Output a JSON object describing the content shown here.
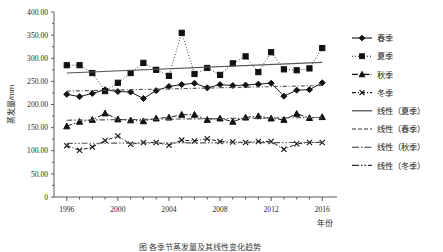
{
  "figure": {
    "caption": "图 各季节蒸发量及其线性变化趋势",
    "background": "#ffffff",
    "ink_color": "#111111",
    "trend_color": "#555555"
  },
  "axes": {
    "y_title": "蒸发量/mm",
    "x_title": "年份",
    "y_ticklabels": [
      "400.00",
      "350.00",
      "300.00",
      "250.00",
      "200.00",
      "150.00",
      "100.00",
      "50.00",
      "0"
    ],
    "y_tickvalues": [
      400,
      350,
      300,
      250,
      200,
      150,
      100,
      50,
      0
    ],
    "x_ticklabels": [
      "1996",
      "2000",
      "2004",
      "2008",
      "2012",
      "2016"
    ],
    "x_tickvalues": [
      1996,
      2000,
      2004,
      2008,
      2012,
      2016
    ]
  },
  "legend": {
    "items": [
      {
        "label": "春季",
        "style": "solid-diamond",
        "marker": "diamond",
        "dash": "none"
      },
      {
        "label": "夏季",
        "style": "dotted-square",
        "marker": "square",
        "dash": "1,2"
      },
      {
        "label": "秋季",
        "style": "dashdot-triangle",
        "marker": "triangle",
        "dash": "6,2,1.5,2"
      },
      {
        "label": "冬季",
        "style": "dashed-cross",
        "marker": "cross",
        "dash": "4,2,1,2"
      },
      {
        "label": "线性（夏季）",
        "style": "solid-line",
        "marker": "none",
        "dash": "none"
      },
      {
        "label": "线性（春季）",
        "style": "dashed-line",
        "marker": "none",
        "dash": "4,2"
      },
      {
        "label": "线性（秋季）",
        "style": "dashdot-line",
        "marker": "none",
        "dash": "7,2,1.5,2"
      },
      {
        "label": "线性（冬季）",
        "style": "dashdotdot-line",
        "marker": "none",
        "dash": "7,2,1.5,2,1.5,2"
      }
    ]
  },
  "chart_data": {
    "type": "line",
    "title": "",
    "xlabel": "年份",
    "ylabel": "蒸发量/mm",
    "xlim": [
      1995,
      2017
    ],
    "ylim": [
      0,
      400
    ],
    "grid": false,
    "legend_position": "right",
    "x": [
      1996,
      1997,
      1998,
      1999,
      2000,
      2001,
      2002,
      2003,
      2004,
      2005,
      2006,
      2007,
      2008,
      2009,
      2010,
      2011,
      2012,
      2013,
      2014,
      2015,
      2016
    ],
    "series": [
      {
        "name": "春季",
        "marker": "diamond",
        "linestyle": "solid",
        "values": [
          222,
          217,
          224,
          232,
          228,
          227,
          213,
          230,
          239,
          243,
          246,
          236,
          243,
          241,
          242,
          244,
          246,
          218,
          231,
          232,
          247
        ]
      },
      {
        "name": "夏季",
        "marker": "square",
        "linestyle": "dotted",
        "values": [
          285,
          285,
          268,
          229,
          247,
          268,
          290,
          275,
          262,
          355,
          266,
          279,
          264,
          289,
          304,
          270,
          313,
          276,
          274,
          278,
          322
        ]
      },
      {
        "name": "秋季",
        "marker": "triangle",
        "linestyle": "dash-dot",
        "values": [
          153,
          163,
          167,
          181,
          168,
          166,
          164,
          170,
          172,
          178,
          178,
          167,
          170,
          163,
          172,
          175,
          170,
          167,
          180,
          171,
          173
        ]
      },
      {
        "name": "冬季",
        "marker": "cross",
        "linestyle": "dashed",
        "values": [
          111,
          101,
          108,
          122,
          132,
          114,
          118,
          118,
          112,
          123,
          121,
          126,
          120,
          119,
          118,
          120,
          120,
          103,
          115,
          118,
          118
        ]
      }
    ],
    "trendlines": [
      {
        "name": "线性（夏季）",
        "linestyle": "solid",
        "y_start": 268,
        "y_end": 291
      },
      {
        "name": "线性（春季）",
        "linestyle": "dashed",
        "y_start": 229,
        "y_end": 241
      },
      {
        "name": "线性（秋季）",
        "linestyle": "dash-dot",
        "y_start": 166,
        "y_end": 172
      },
      {
        "name": "线性（冬季）",
        "linestyle": "dash-dot-dot",
        "y_start": 116,
        "y_end": 118
      }
    ]
  }
}
